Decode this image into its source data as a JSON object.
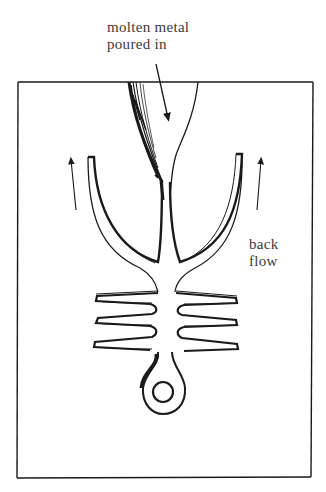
{
  "figure": {
    "labels": {
      "molten_line1": "molten metal",
      "molten_line2": "poured in",
      "back_line1": "back",
      "back_line2": "flow"
    },
    "colors": {
      "ink": "#1a1a1a",
      "text": "#3a3a3a",
      "background": "#ffffff"
    },
    "parts": [
      "mold-frame",
      "pouring-funnel",
      "sprue-cavity",
      "fin-cavities",
      "ring-cavity",
      "backflow-arrows",
      "pour-arrow"
    ]
  }
}
